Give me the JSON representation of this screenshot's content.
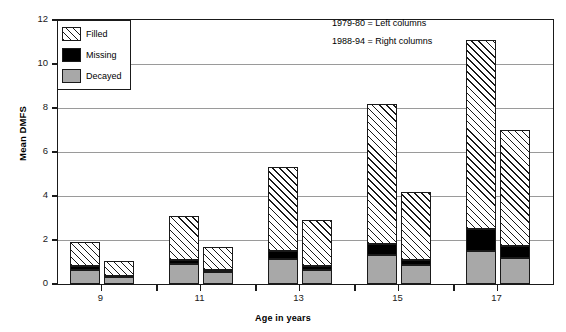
{
  "chart_data": {
    "type": "bar",
    "subtype": "grouped-stacked-bar",
    "title": "",
    "xlabel": "Age in years",
    "ylabel": "Mean DMFS",
    "categories": [
      "9",
      "11",
      "13",
      "15",
      "17"
    ],
    "ylim": [
      0,
      12
    ],
    "yticks": [
      0,
      2,
      4,
      6,
      8,
      10,
      12
    ],
    "xticks": [
      "9",
      "11",
      "13",
      "15",
      "17"
    ],
    "grid": true,
    "legend_position": "top-left-inside",
    "groups": [
      {
        "name": "1979-80",
        "position": "left",
        "stack_order": [
          "Decayed",
          "Missing",
          "Filled"
        ],
        "series": [
          {
            "name": "Decayed",
            "values": [
              0.65,
              0.9,
              1.15,
              1.3,
              1.5
            ]
          },
          {
            "name": "Missing",
            "values": [
              0.15,
              0.2,
              0.35,
              0.5,
              1.0
            ]
          },
          {
            "name": "Filled",
            "values": [
              1.1,
              2.0,
              3.8,
              6.4,
              8.6
            ]
          }
        ],
        "totals": [
          1.9,
          3.1,
          5.3,
          8.2,
          11.1
        ]
      },
      {
        "name": "1988-94",
        "position": "right",
        "stack_order": [
          "Decayed",
          "Missing",
          "Filled"
        ],
        "series": [
          {
            "name": "Decayed",
            "values": [
              0.3,
              0.55,
              0.65,
              0.85,
              1.2
            ]
          },
          {
            "name": "Missing",
            "values": [
              0.05,
              0.1,
              0.15,
              0.25,
              0.55
            ]
          },
          {
            "name": "Filled",
            "values": [
              0.7,
              1.05,
              2.1,
              3.1,
              5.25
            ]
          }
        ],
        "totals": [
          1.05,
          1.7,
          2.9,
          4.2,
          7.0
        ]
      }
    ],
    "legend": [
      {
        "label": "Filled",
        "swatch": "diagonal-hatch",
        "color": "#ffffff"
      },
      {
        "label": "Missing",
        "swatch": "solid",
        "color": "#000000"
      },
      {
        "label": "Decayed",
        "swatch": "solid",
        "color": "#a8a8a8"
      }
    ],
    "annotations": [
      "1979-80 = Left columns",
      "1988-94 = Right columns"
    ],
    "colors": {
      "decayed": "#a8a8a8",
      "missing": "#000000",
      "filled_hatch": "#1a1a1a",
      "axis": "#1a1a1a",
      "grid": "#9a9a9a"
    }
  }
}
